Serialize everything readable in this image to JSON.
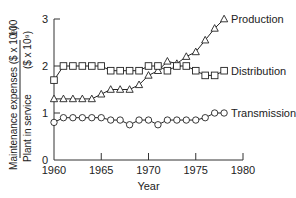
{
  "chart_data": {
    "type": "line",
    "title": "",
    "xlabel": "Year",
    "ylabel_numerator": "Maintenance expenses ($ x 10⁹)",
    "ylabel_denominator": "Plant in service ($ x 10⁹)",
    "ylabel_multiplier": "100",
    "xlim": [
      1960,
      1980
    ],
    "ylim": [
      0,
      3
    ],
    "xticks": [
      "1960",
      "1965",
      "1970",
      "1975",
      "1980"
    ],
    "yticks": [
      "0",
      "1",
      "2",
      "3"
    ],
    "grid": false,
    "legend_position": "inline-right",
    "x": [
      1960,
      1961,
      1962,
      1963,
      1964,
      1965,
      1966,
      1967,
      1968,
      1969,
      1970,
      1971,
      1972,
      1973,
      1974,
      1975,
      1976,
      1977,
      1978
    ],
    "series": [
      {
        "name": "Production",
        "marker": "triangle",
        "values": [
          1.3,
          1.3,
          1.3,
          1.3,
          1.3,
          1.4,
          1.5,
          1.5,
          1.5,
          1.6,
          1.8,
          1.9,
          2.1,
          2.05,
          2.2,
          2.3,
          2.55,
          2.8,
          3.0
        ]
      },
      {
        "name": "Distribution",
        "marker": "square",
        "values": [
          1.7,
          2.0,
          2.0,
          2.0,
          2.0,
          2.0,
          1.9,
          1.9,
          1.9,
          1.9,
          2.0,
          2.0,
          1.9,
          2.0,
          2.0,
          1.9,
          1.8,
          1.8,
          1.9
        ]
      },
      {
        "name": "Transmission",
        "marker": "circle",
        "values": [
          0.8,
          0.9,
          0.9,
          0.9,
          0.9,
          0.9,
          0.85,
          0.85,
          0.75,
          0.85,
          0.85,
          0.75,
          0.85,
          0.85,
          0.85,
          0.85,
          0.9,
          1.0,
          1.0
        ]
      }
    ]
  }
}
